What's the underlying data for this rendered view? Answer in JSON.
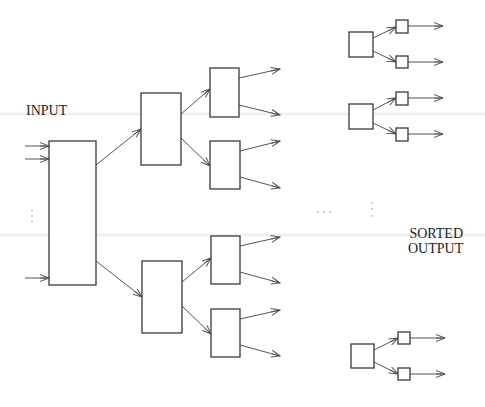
{
  "diagram": {
    "labels": {
      "input": "INPUT",
      "sorted_line1": "SORTED",
      "sorted_line2": "OUTPUT"
    },
    "colors": {
      "stroke": "#3a3a3a",
      "arrow": "#555555",
      "text": "#222222",
      "background": "#ffffff"
    },
    "ellipsis": {
      "input_vertical": "⋮",
      "middle_horizontal": "…",
      "middle_vertical": "⋮"
    },
    "nodes": [
      {
        "id": "root",
        "x": 49,
        "y": 141,
        "w": 47,
        "h": 144
      },
      {
        "id": "mid-top",
        "x": 141,
        "y": 93,
        "w": 40,
        "h": 72
      },
      {
        "id": "mid-bottom",
        "x": 142,
        "y": 261,
        "w": 40,
        "h": 72
      },
      {
        "id": "leaf-1",
        "x": 210,
        "y": 68,
        "w": 29,
        "h": 49
      },
      {
        "id": "leaf-2",
        "x": 210,
        "y": 141,
        "w": 30,
        "h": 48
      },
      {
        "id": "leaf-3",
        "x": 211,
        "y": 236,
        "w": 29,
        "h": 48
      },
      {
        "id": "leaf-4",
        "x": 211,
        "y": 309,
        "w": 29,
        "h": 48
      },
      {
        "id": "out-group-1",
        "x": 349,
        "y": 32,
        "w": 24,
        "h": 25
      },
      {
        "id": "out-group-2",
        "x": 349,
        "y": 104,
        "w": 24,
        "h": 25
      },
      {
        "id": "out-group-3",
        "x": 351,
        "y": 344,
        "w": 23,
        "h": 24
      },
      {
        "id": "out-1a",
        "x": 396,
        "y": 20,
        "w": 12,
        "h": 13
      },
      {
        "id": "out-1b",
        "x": 396,
        "y": 56,
        "w": 12,
        "h": 12
      },
      {
        "id": "out-2a",
        "x": 396,
        "y": 92,
        "w": 12,
        "h": 13
      },
      {
        "id": "out-2b",
        "x": 396,
        "y": 128,
        "w": 12,
        "h": 13
      },
      {
        "id": "out-3a",
        "x": 398,
        "y": 332,
        "w": 12,
        "h": 12
      },
      {
        "id": "out-3b",
        "x": 398,
        "y": 368,
        "w": 12,
        "h": 12
      }
    ],
    "edges": [
      [
        25,
        146,
        49,
        146
      ],
      [
        25,
        159,
        49,
        159
      ],
      [
        25,
        278,
        49,
        278
      ],
      [
        96,
        165,
        141,
        129
      ],
      [
        96,
        261,
        142,
        297
      ],
      [
        181,
        114,
        210,
        89
      ],
      [
        181,
        138,
        210,
        166
      ],
      [
        182,
        282,
        211,
        258
      ],
      [
        182,
        306,
        211,
        334
      ],
      [
        239,
        78,
        280,
        69
      ],
      [
        239,
        105,
        280,
        115
      ],
      [
        240,
        151,
        280,
        141
      ],
      [
        240,
        177,
        280,
        188
      ],
      [
        240,
        246,
        280,
        237
      ],
      [
        240,
        272,
        280,
        283
      ],
      [
        240,
        319,
        280,
        310
      ],
      [
        240,
        345,
        280,
        356
      ],
      [
        373,
        38,
        396,
        27
      ],
      [
        373,
        51,
        396,
        62
      ],
      [
        373,
        110,
        396,
        98
      ],
      [
        373,
        123,
        396,
        134
      ],
      [
        374,
        350,
        398,
        338
      ],
      [
        374,
        362,
        398,
        374
      ],
      [
        408,
        26,
        443,
        26
      ],
      [
        408,
        62,
        443,
        62
      ],
      [
        408,
        98,
        443,
        98
      ],
      [
        408,
        134,
        443,
        134
      ],
      [
        410,
        338,
        445,
        338
      ],
      [
        410,
        374,
        445,
        374
      ]
    ],
    "dots": [
      [
        32,
        210
      ],
      [
        32,
        216
      ],
      [
        32,
        222
      ],
      [
        318,
        212
      ],
      [
        324,
        212
      ],
      [
        330,
        212
      ],
      [
        372,
        203
      ],
      [
        372,
        209
      ],
      [
        372,
        216
      ]
    ]
  }
}
